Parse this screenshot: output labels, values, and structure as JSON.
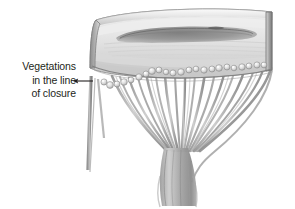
{
  "figure": {
    "kind": "grayscale-pencil-medical-illustration",
    "background_color": "#ffffff",
    "ink_color": "#231f20",
    "shading_color": "#9a9a9a"
  },
  "annotation": {
    "lines": [
      "Vegetations",
      "in the line",
      "of closure"
    ],
    "line1": "Vegetations",
    "line2": "in the line",
    "line3": "of closure",
    "arrow": {
      "name": "leftward-pointer",
      "direction": "left",
      "color": "#231f20"
    }
  },
  "structures": {
    "valve_cuff": "valve ring / annulus wall",
    "valve_orifice": "dark elongated orifice opening",
    "vegetations": "row of small rounded nodules along the closure line",
    "chordae": "fan of chordae tendineae",
    "papillary_muscle": "papillary muscle trunk",
    "left_strand": "lateral chordal strand"
  }
}
